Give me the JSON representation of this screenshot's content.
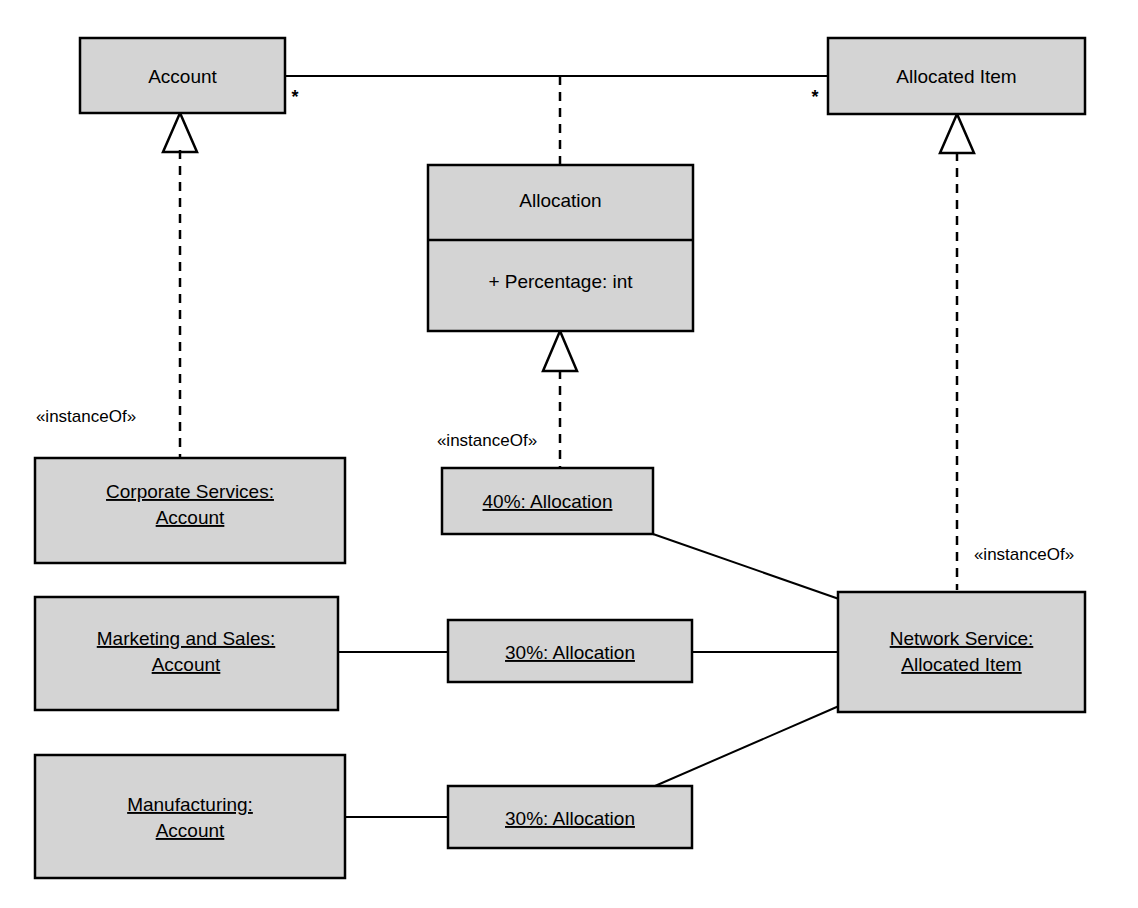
{
  "diagram": {
    "notation": "UML class and object diagram",
    "colors": {
      "box_fill": "#d4d4d4",
      "stroke": "#000000",
      "background": "#ffffff"
    },
    "classes": [
      {
        "id": "account",
        "name": "Account",
        "compartments": []
      },
      {
        "id": "allocated-item",
        "name": "Allocated Item",
        "compartments": []
      },
      {
        "id": "allocation",
        "name": "Allocation",
        "compartments": [
          {
            "attribute": "+ Percentage: int"
          }
        ]
      }
    ],
    "objects": [
      {
        "id": "corporate-services",
        "line1": "Corporate Services:",
        "line2": "Account"
      },
      {
        "id": "marketing-and-sales",
        "line1": "Marketing and Sales:",
        "line2": "Account"
      },
      {
        "id": "manufacturing",
        "line1": "Manufacturing:",
        "line2": "Account"
      },
      {
        "id": "allocation-40",
        "line1": "40%: Allocation",
        "line2": ""
      },
      {
        "id": "allocation-30-middle",
        "line1": "30%: Allocation",
        "line2": ""
      },
      {
        "id": "allocation-30-bottom",
        "line1": "30%: Allocation",
        "line2": ""
      },
      {
        "id": "network-service",
        "line1": "Network Service:",
        "line2": "Allocated Item"
      }
    ],
    "multiplicities": {
      "account_end": "*",
      "allocated_item_end": "*"
    },
    "stereotypes": {
      "instance_of": "«instanceOf»"
    },
    "labels": {
      "instance_of_account": "«instanceOf»",
      "instance_of_allocation": "«instanceOf»",
      "instance_of_allocated_item": "«instanceOf»"
    }
  }
}
